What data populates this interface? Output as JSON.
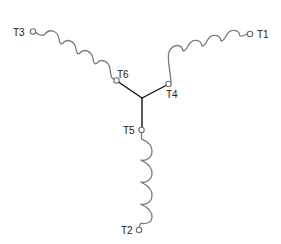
{
  "diagram": {
    "colors": {
      "background": "#ffffff",
      "coil": "#7a7a7a",
      "wire": "#111111",
      "terminal": "#6e6e6e",
      "label": "#1a1a1a"
    },
    "terminals": [
      {
        "id": "T1",
        "label": "T1"
      },
      {
        "id": "T2",
        "label": "T2"
      },
      {
        "id": "T3",
        "label": "T3"
      },
      {
        "id": "T4",
        "label": "T4"
      },
      {
        "id": "T5",
        "label": "T5"
      },
      {
        "id": "T6",
        "label": "T6"
      }
    ],
    "windings": [
      {
        "name": "winding-1",
        "from": "T1",
        "to": "T4",
        "loops": 4
      },
      {
        "name": "winding-2",
        "from": "T2",
        "to": "T5",
        "loops": 4
      },
      {
        "name": "winding-3",
        "from": "T3",
        "to": "T6",
        "loops": 4
      }
    ],
    "star_point": {
      "connects": [
        "T4",
        "T5",
        "T6"
      ]
    }
  }
}
